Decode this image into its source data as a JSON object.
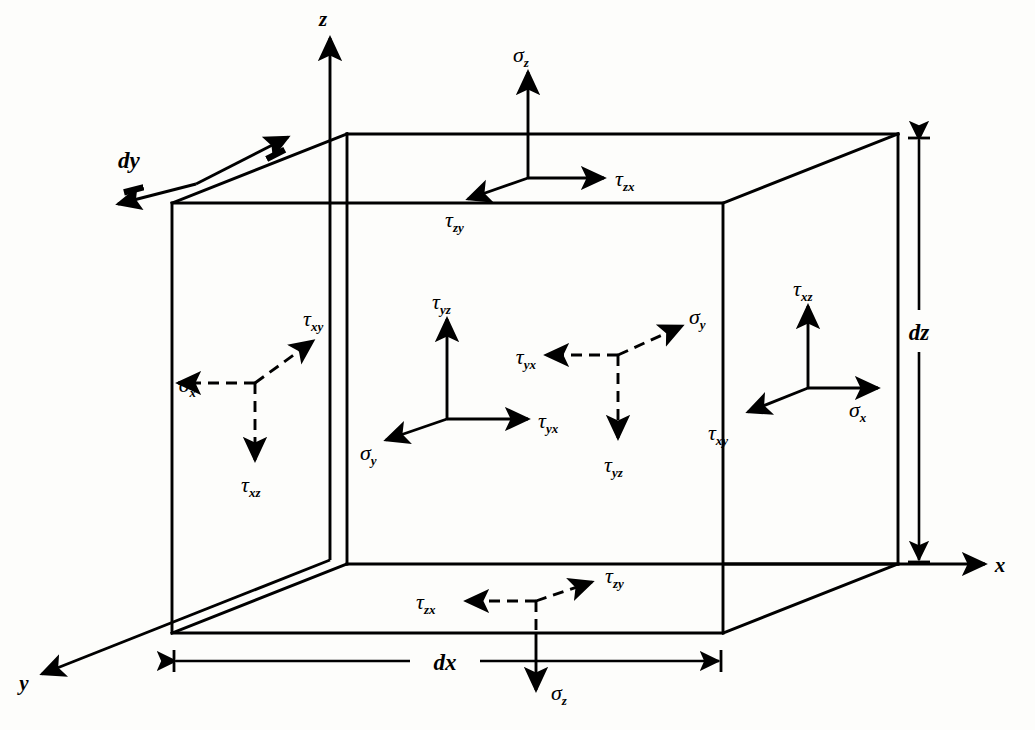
{
  "figure": {
    "caption": "",
    "stroke_color": "#000000",
    "background_color": "#fdfdfb"
  },
  "axes": [
    {
      "name": "z-axis",
      "label": "z",
      "direction": "up"
    },
    {
      "name": "x-axis",
      "label": "x",
      "direction": "right"
    },
    {
      "name": "y-axis",
      "label": "y",
      "direction": "down-left"
    }
  ],
  "dimensions": [
    {
      "name": "dx",
      "label": "dx",
      "orientation": "horizontal",
      "location": "bottom-front-edge"
    },
    {
      "name": "dy",
      "label": "dy",
      "orientation": "diagonal",
      "location": "top-left-depth-edge"
    },
    {
      "name": "dz",
      "label": "dz",
      "orientation": "vertical",
      "location": "right-outside"
    }
  ],
  "faces": [
    {
      "name": "top-face",
      "style": "solid",
      "stresses": [
        {
          "symbol": "σ",
          "sub": "z",
          "dir": "up"
        },
        {
          "symbol": "τ",
          "sub": "zx",
          "dir": "right"
        },
        {
          "symbol": "τ",
          "sub": "zy",
          "dir": "down-left"
        }
      ]
    },
    {
      "name": "bottom-face",
      "style": "dashed",
      "stresses": [
        {
          "symbol": "σ",
          "sub": "z",
          "dir": "down"
        },
        {
          "symbol": "τ",
          "sub": "zx",
          "dir": "left"
        },
        {
          "symbol": "τ",
          "sub": "zy",
          "dir": "up-right"
        }
      ]
    },
    {
      "name": "left-face",
      "style": "dashed",
      "stresses": [
        {
          "symbol": "σ",
          "sub": "x",
          "dir": "left"
        },
        {
          "symbol": "τ",
          "sub": "xy",
          "dir": "up-right"
        },
        {
          "symbol": "τ",
          "sub": "xz",
          "dir": "down"
        }
      ]
    },
    {
      "name": "right-face",
      "style": "solid",
      "stresses": [
        {
          "symbol": "σ",
          "sub": "x",
          "dir": "right"
        },
        {
          "symbol": "τ",
          "sub": "xy",
          "dir": "down-left"
        },
        {
          "symbol": "τ",
          "sub": "xz",
          "dir": "up"
        }
      ]
    },
    {
      "name": "front-face",
      "style": "solid",
      "stresses": [
        {
          "symbol": "σ",
          "sub": "y",
          "dir": "down-left"
        },
        {
          "symbol": "τ",
          "sub": "yx",
          "dir": "right"
        },
        {
          "symbol": "τ",
          "sub": "yz",
          "dir": "up"
        }
      ]
    },
    {
      "name": "back-face",
      "style": "dashed",
      "stresses": [
        {
          "symbol": "σ",
          "sub": "y",
          "dir": "up-right"
        },
        {
          "symbol": "τ",
          "sub": "yx",
          "dir": "left"
        },
        {
          "symbol": "τ",
          "sub": "yz",
          "dir": "down"
        }
      ]
    }
  ],
  "labels": {
    "axis_z": "z",
    "axis_x": "x",
    "axis_y": "y",
    "dim_dx": "dx",
    "dim_dy": "dy",
    "dim_dz": "dz",
    "sigma": "σ",
    "tau": "τ",
    "sub_z": "z",
    "sub_x": "x",
    "sub_y": "y",
    "sub_zx": "zx",
    "sub_zy": "zy",
    "sub_xy": "xy",
    "sub_xz": "xz",
    "sub_yx": "yx",
    "sub_yz": "yz"
  }
}
